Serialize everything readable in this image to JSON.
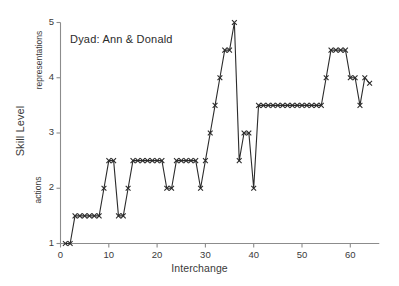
{
  "chart_data": {
    "type": "line",
    "title": "Dyad: Ann & Donald",
    "xlabel": "Interchange",
    "ylabel": "Skill Level",
    "ylabel_upper_band": "representations",
    "ylabel_lower_band": "actions",
    "xlim": [
      0,
      66
    ],
    "ylim": [
      1,
      5
    ],
    "xticks": [
      0,
      10,
      20,
      30,
      40,
      50,
      60
    ],
    "yticks": [
      1,
      2,
      3,
      4,
      5
    ],
    "grid": false,
    "legend": null,
    "marker": "x",
    "line_color": "#2b2b2b",
    "axis_color": "#8c8c8c",
    "series": [
      {
        "name": "Skill Level",
        "x": [
          1,
          2,
          3,
          4,
          5,
          6,
          7,
          8,
          9,
          10,
          11,
          12,
          13,
          14,
          15,
          16,
          17,
          18,
          19,
          20,
          21,
          22,
          23,
          24,
          25,
          26,
          27,
          28,
          29,
          30,
          31,
          32,
          33,
          34,
          35,
          36,
          37,
          38,
          39,
          40,
          41,
          42,
          43,
          44,
          45,
          46,
          47,
          48,
          49,
          50,
          51,
          52,
          53,
          54,
          55,
          56,
          57,
          58,
          59,
          60,
          61,
          62,
          63,
          64
        ],
        "values": [
          1,
          1,
          1.5,
          1.5,
          1.5,
          1.5,
          1.5,
          1.5,
          2,
          2.5,
          2.5,
          1.5,
          1.5,
          2,
          2.5,
          2.5,
          2.5,
          2.5,
          2.5,
          2.5,
          2.5,
          2,
          2,
          2.5,
          2.5,
          2.5,
          2.5,
          2.5,
          2,
          2.5,
          3,
          3.5,
          4,
          4.5,
          4.5,
          5,
          2.5,
          3,
          3,
          2,
          3.5,
          3.5,
          3.5,
          3.5,
          3.5,
          3.5,
          3.5,
          3.5,
          3.5,
          3.5,
          3.5,
          3.5,
          3.5,
          3.5,
          4,
          4.5,
          4.5,
          4.5,
          4.5,
          4,
          4,
          3.5,
          4,
          3.9
        ]
      }
    ]
  }
}
